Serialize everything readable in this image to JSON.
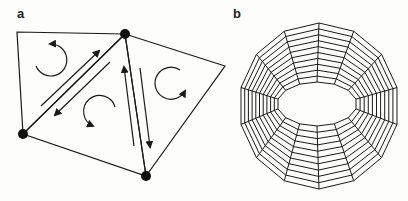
{
  "panels": [
    {
      "label": "a",
      "description": "Triangular mesh with vertices, circulation arrows and opposing half-edge arrows"
    },
    {
      "label": "b",
      "description": "Tubular ring mesh with radial segments and striped quads"
    }
  ],
  "colors": {
    "ink": "#1a1a1a",
    "background": "#fdfdfc"
  },
  "panel_a": {
    "vertices": [
      [
        17,
        32
      ],
      [
        125,
        34
      ],
      [
        225,
        66
      ],
      [
        23,
        134
      ],
      [
        146,
        176
      ]
    ],
    "dots": [
      [
        125,
        34
      ],
      [
        23,
        134
      ],
      [
        146,
        176
      ]
    ]
  },
  "panel_b": {
    "center": [
      325,
      106
    ],
    "segments": 14,
    "stripes_per_segment": 9
  }
}
